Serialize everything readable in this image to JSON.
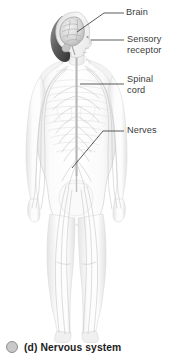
{
  "figure": {
    "caption_bullet": "circle-bullet-icon",
    "caption": "(d) Nervous system",
    "background_color": "#ffffff",
    "label_color": "#3b3b3b",
    "caption_color": "#1d1d1d",
    "bullet_color": "#c9c9c9",
    "leader_line_color": "#3d3d3d"
  },
  "labels": {
    "brain": "Brain",
    "sensory_receptor": "Sensory\nreceptor",
    "spinal_cord": "Spinal\ncord",
    "nerves": "Nerves"
  }
}
